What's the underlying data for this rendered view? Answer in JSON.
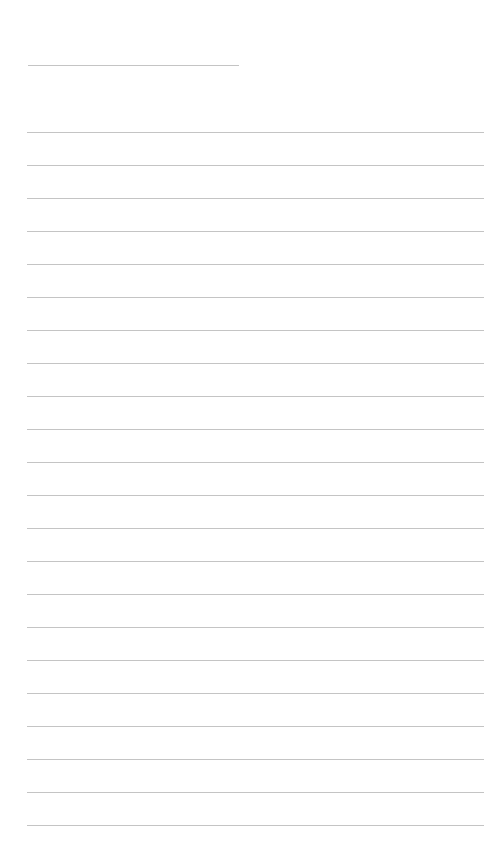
{
  "document": {
    "type": "lined writing sheet",
    "line_color": "#c4c4c4",
    "header_line": {
      "top": 65,
      "left": 28,
      "width": 211
    },
    "writing_lines": {
      "count": 22,
      "first_top": 132,
      "spacing": 33,
      "left": 27,
      "width": 457
    }
  }
}
